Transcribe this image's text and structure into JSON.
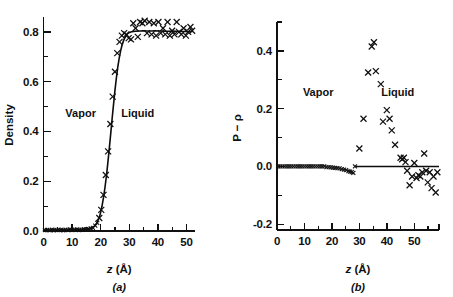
{
  "figure": {
    "panels": [
      {
        "id": "a",
        "caption": "(a)",
        "xlabel": "z (Å)",
        "ylabel": "Density",
        "region_left": "Vapor",
        "region_right": "Liquid"
      },
      {
        "id": "b",
        "caption": "(b)",
        "xlabel": "z (Å)",
        "ylabel": "P − ρ",
        "region_left": "Vapor",
        "region_right": "Liquid"
      }
    ]
  },
  "chart_data": [
    {
      "type": "scatter",
      "id": "panel-a",
      "title": "",
      "xlabel": "z (Å)",
      "ylabel": "Density",
      "xlim": [
        0,
        53
      ],
      "ylim": [
        0.0,
        0.86
      ],
      "xticks": [
        0,
        10,
        20,
        30,
        40,
        50
      ],
      "xtick_labels": [
        "0",
        "10",
        "20",
        "30",
        "40",
        "50"
      ],
      "xminor_ticks": [
        5,
        15,
        25,
        35,
        45
      ],
      "yticks": [
        0.0,
        0.2,
        0.4,
        0.6,
        0.8
      ],
      "ytick_labels": [
        "0.0",
        "0.2",
        "0.4",
        "0.6",
        "0.8"
      ],
      "yminor_ticks": [
        0.1,
        0.3,
        0.5,
        0.7
      ],
      "grid": false,
      "legend": null,
      "annotations": [
        {
          "text": "Vapor",
          "x": 13,
          "y": 0.46
        },
        {
          "text": "Liquid",
          "x": 33,
          "y": 0.46
        }
      ],
      "series": [
        {
          "name": "fit curve",
          "type": "line",
          "x": [
            0,
            2,
            4,
            6,
            8,
            10,
            12,
            14,
            15,
            16,
            17,
            18,
            19,
            20,
            21,
            22,
            23,
            24,
            25,
            26,
            27,
            28,
            29,
            30,
            31,
            32,
            34,
            36,
            38,
            40,
            42,
            44,
            46,
            48,
            50,
            52
          ],
          "y": [
            0.003,
            0.003,
            0.003,
            0.003,
            0.004,
            0.004,
            0.005,
            0.006,
            0.007,
            0.009,
            0.013,
            0.022,
            0.04,
            0.075,
            0.135,
            0.22,
            0.33,
            0.45,
            0.565,
            0.66,
            0.725,
            0.765,
            0.787,
            0.797,
            0.801,
            0.803,
            0.804,
            0.804,
            0.804,
            0.804,
            0.803,
            0.803,
            0.803,
            0.802,
            0.802,
            0.802
          ]
        },
        {
          "name": "simulation data",
          "type": "scatter",
          "marker": "x",
          "x": [
            0.5,
            1.3,
            2.1,
            2.9,
            3.7,
            4.5,
            5.3,
            6.1,
            6.9,
            7.7,
            8.5,
            9.3,
            10.1,
            10.9,
            11.7,
            12.5,
            13.3,
            14.1,
            14.9,
            15.7,
            16.5,
            17.3,
            18.1,
            18.8,
            19.5,
            20.2,
            21.0,
            21.8,
            22.6,
            23.4,
            24.2,
            25.0,
            25.8,
            26.6,
            27.4,
            28.2,
            29.0,
            29.8,
            30.6,
            31.4,
            32.2,
            33.0,
            33.8,
            34.6,
            35.4,
            36.2,
            37.0,
            37.8,
            38.6,
            39.4,
            40.2,
            41.0,
            41.8,
            42.6,
            43.4,
            44.2,
            45.0,
            45.8,
            46.6,
            47.4,
            48.2,
            49.0,
            49.8,
            50.6,
            51.4,
            52.0
          ],
          "y": [
            0.004,
            0.004,
            0.003,
            0.005,
            0.003,
            0.004,
            0.005,
            0.004,
            0.003,
            0.005,
            0.004,
            0.006,
            0.004,
            0.005,
            0.006,
            0.004,
            0.005,
            0.007,
            0.006,
            0.008,
            0.01,
            0.013,
            0.022,
            0.033,
            0.052,
            0.085,
            0.145,
            0.225,
            0.32,
            0.43,
            0.54,
            0.64,
            0.715,
            0.76,
            0.785,
            0.795,
            0.79,
            0.775,
            0.77,
            0.835,
            0.815,
            0.78,
            0.84,
            0.835,
            0.845,
            0.795,
            0.84,
            0.79,
            0.835,
            0.785,
            0.84,
            0.795,
            0.815,
            0.79,
            0.84,
            0.785,
            0.805,
            0.79,
            0.84,
            0.8,
            0.79,
            0.815,
            0.785,
            0.8,
            0.82,
            0.805
          ]
        }
      ]
    },
    {
      "type": "scatter",
      "id": "panel-b",
      "title": "",
      "xlabel": "z (Å)",
      "ylabel": "P − ρ",
      "xlim": [
        0,
        59
      ],
      "ylim": [
        -0.22,
        0.5
      ],
      "xticks": [
        0,
        10,
        20,
        30,
        40,
        50
      ],
      "xtick_labels": [
        "0",
        "10",
        "20",
        "30",
        "40",
        "50"
      ],
      "xminor_ticks": [
        5,
        15,
        25,
        35,
        45,
        55
      ],
      "yticks": [
        -0.2,
        0.0,
        0.2,
        0.4
      ],
      "ytick_labels": [
        "-0.2",
        "0.0",
        "0.2",
        "0.4"
      ],
      "yminor_ticks": [
        -0.1,
        0.1,
        0.3,
        0.5
      ],
      "grid": false,
      "legend": null,
      "annotations": [
        {
          "text": "Vapor",
          "x": 15,
          "y": 0.245
        },
        {
          "text": "Liquid",
          "x": 44,
          "y": 0.245
        }
      ],
      "series": [
        {
          "name": "zero reference line",
          "type": "line",
          "x": [
            28.5,
            59
          ],
          "y": [
            0.0,
            0.0
          ]
        },
        {
          "name": "pressure deviation data",
          "type": "scatter",
          "marker": "x",
          "x": [
            0.4,
            1.2,
            2.0,
            2.8,
            3.6,
            4.4,
            5.2,
            6.0,
            6.8,
            7.6,
            8.4,
            9.2,
            10.0,
            10.8,
            11.6,
            12.4,
            13.2,
            14.0,
            14.8,
            15.6,
            16.4,
            17.2,
            18.0,
            18.8,
            19.6,
            20.4,
            21.2,
            22.0,
            22.8,
            23.6,
            24.4,
            25.2,
            26.0,
            26.6,
            27.2,
            27.8,
            28.4,
            30.0,
            31.5,
            33.2,
            34.5,
            35.3,
            36.0,
            37.8,
            38.6,
            40.0,
            41.0,
            41.8,
            43.0,
            45.0,
            45.6,
            46.2,
            46.8,
            47.4,
            48.3,
            49.2,
            50.0,
            50.8,
            51.5,
            52.2,
            52.9,
            53.6,
            54.3,
            54.9,
            55.6,
            56.3,
            57.0,
            57.8,
            58.4
          ],
          "y": [
            0.0,
            0.0,
            0.0,
            0.0,
            0.0,
            0.0,
            0.0,
            0.0,
            0.0,
            0.0,
            0.0,
            0.0,
            0.0,
            0.0,
            0.0,
            0.0,
            0.0,
            0.0,
            0.0,
            0.0,
            0.0,
            0.0,
            -0.002,
            -0.002,
            -0.003,
            -0.004,
            -0.005,
            -0.006,
            -0.007,
            -0.009,
            -0.011,
            -0.013,
            -0.016,
            -0.018,
            -0.02,
            -0.022,
            0.0,
            0.062,
            0.165,
            0.325,
            0.415,
            0.43,
            0.33,
            0.285,
            0.155,
            0.195,
            0.165,
            0.125,
            0.075,
            0.03,
            0.025,
            0.03,
            0.015,
            -0.015,
            -0.065,
            -0.035,
            0.012,
            -0.04,
            -0.03,
            -0.035,
            -0.02,
            0.045,
            -0.015,
            -0.055,
            -0.02,
            -0.075,
            -0.035,
            -0.09,
            -0.02
          ]
        }
      ]
    }
  ]
}
